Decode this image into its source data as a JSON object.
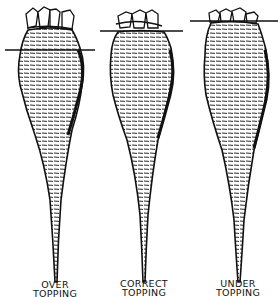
{
  "figure": {
    "colors": {
      "ink": "#111111",
      "background": "#ffffff"
    },
    "beets": [
      {
        "id": "over",
        "label_line1": "OVER",
        "label_line2": "TOPPING"
      },
      {
        "id": "correct",
        "label_line1": "CORRECT",
        "label_line2": "TOPPING"
      },
      {
        "id": "under",
        "label_line1": "UNDER",
        "label_line2": "TOPPING"
      }
    ]
  }
}
